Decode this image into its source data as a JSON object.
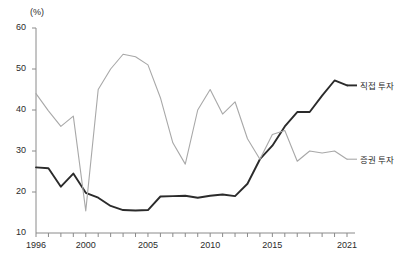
{
  "chart_data": {
    "type": "line",
    "title": "",
    "xlabel": "",
    "ylabel": "(%)",
    "unit_label": "(%)",
    "xlim": [
      1996,
      2021
    ],
    "ylim": [
      10,
      60
    ],
    "ytick_labels": [
      "10",
      "20",
      "30",
      "40",
      "50",
      "60"
    ],
    "yticks": [
      10,
      20,
      30,
      40,
      50,
      60
    ],
    "xtick_labels": [
      "1996",
      "2000",
      "2005",
      "2010",
      "2015",
      "2021"
    ],
    "xticks": [
      1996,
      2000,
      2005,
      2010,
      2015,
      2021
    ],
    "minor_xticks_every": 1,
    "grid": false,
    "legend_position": "right-inline",
    "x": [
      1996,
      1997,
      1998,
      1999,
      2000,
      2001,
      2002,
      2003,
      2004,
      2005,
      2006,
      2007,
      2008,
      2009,
      2010,
      2011,
      2012,
      2013,
      2014,
      2015,
      2016,
      2017,
      2018,
      2019,
      2020,
      2021
    ],
    "series": [
      {
        "name": "직접 투자",
        "color": "#2b2b2b",
        "width": 1.9,
        "values": [
          26.0,
          25.8,
          21.3,
          24.5,
          19.8,
          18.6,
          16.6,
          15.6,
          15.5,
          15.6,
          18.9,
          19.0,
          19.1,
          18.6,
          19.1,
          19.4,
          19.0,
          22.0,
          28.0,
          31.3,
          36.0,
          39.5,
          39.5,
          43.5,
          47.2,
          46.0
        ]
      },
      {
        "name": "증권 투자",
        "color": "#a8a8a8",
        "width": 1.1,
        "values": [
          44.0,
          39.8,
          36.0,
          38.5,
          15.4,
          45.0,
          50.0,
          53.6,
          53.0,
          51.0,
          43.0,
          32.0,
          26.8,
          40.0,
          45.0,
          39.0,
          42.0,
          33.0,
          28.0,
          34.0,
          35.0,
          27.5,
          30.0,
          29.5,
          30.0,
          28.0
        ]
      }
    ],
    "annotations": [
      {
        "text": "직접 투자",
        "x": 2021.6,
        "y": 46.0
      },
      {
        "text": "증권 투자",
        "x": 2021.6,
        "y": 28.0
      }
    ]
  }
}
